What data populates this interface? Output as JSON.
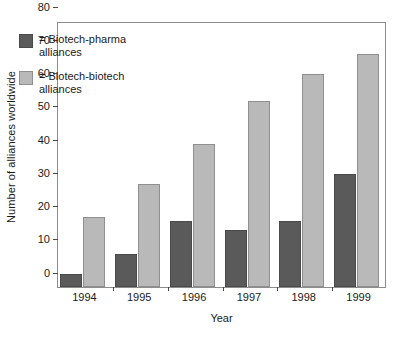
{
  "chart_data": {
    "type": "bar",
    "title": "",
    "xlabel": "Year",
    "ylabel": "Number of alliances worldwide",
    "categories": [
      "1994",
      "1995",
      "1996",
      "1997",
      "1998",
      "1999"
    ],
    "series": [
      {
        "name": "= Biotech-pharma\nalliances",
        "values": [
          4,
          10,
          20,
          17,
          20,
          34
        ],
        "color": "#5a5a5a"
      },
      {
        "name": "= Biotech-biotech\nalliances",
        "values": [
          21,
          31,
          43,
          56,
          64,
          70
        ],
        "color": "#b9b9b9"
      }
    ],
    "ylim": [
      0,
      80
    ],
    "yticks": [
      0,
      10,
      20,
      30,
      40,
      50,
      60,
      70,
      80
    ],
    "grid": false,
    "legend_position": "upper-left-inside",
    "legend": [
      "= Biotech-pharma\nalliances",
      "= Biotech-biotech\nalliances"
    ]
  }
}
